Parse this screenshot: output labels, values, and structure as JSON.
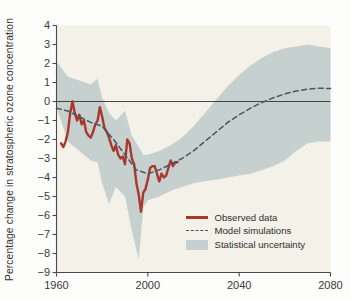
{
  "figure": {
    "background": "#fdfdfb",
    "plot_background": "#f4f1e9"
  },
  "axis": {
    "ylabel": "Percentage change in stratospheric ozone concentration",
    "xlabel": "",
    "y_ticks": [
      "4",
      "3",
      "2",
      "1",
      "0",
      "−1",
      "−2",
      "−3",
      "−4",
      "−5",
      "−6",
      "−7",
      "−8",
      "−9"
    ],
    "x_ticks": [
      "1960",
      "2000",
      "2040",
      "2080"
    ]
  },
  "legend": {
    "items": [
      {
        "label": "Observed data",
        "key": "solid-line",
        "color": "#a8372c"
      },
      {
        "label": "Model simulations",
        "key": "dashed-line",
        "color": "#4a5668"
      },
      {
        "label": "Statistical uncertainty",
        "key": "filled-band",
        "color": "#c2cdcd"
      }
    ]
  },
  "chart_data": {
    "type": "line",
    "title": "",
    "xlabel": "",
    "ylabel": "Percentage change in stratospheric ozone concentration",
    "xlim": [
      1960,
      2080
    ],
    "ylim": [
      -9,
      4
    ],
    "xticks": [
      1960,
      2000,
      2040,
      2080
    ],
    "yticks": [
      -9,
      -8,
      -7,
      -6,
      -5,
      -4,
      -3,
      -2,
      -1,
      0,
      1,
      2,
      3,
      4
    ],
    "grid": false,
    "legend_position": "lower right",
    "zero_line": 0,
    "series": [
      {
        "name": "Observed data",
        "type": "line",
        "color": "#a8372c",
        "linestyle": "solid",
        "x": [
          1962,
          1963,
          1964,
          1965,
          1966,
          1967,
          1968,
          1969,
          1970,
          1971,
          1972,
          1973,
          1974,
          1975,
          1976,
          1977,
          1978,
          1979,
          1980,
          1981,
          1982,
          1983,
          1984,
          1985,
          1986,
          1987,
          1988,
          1989,
          1990,
          1991,
          1992,
          1993,
          1994,
          1995,
          1996,
          1997,
          1998,
          1999,
          2000,
          2001,
          2002,
          2003,
          2004,
          2005,
          2006,
          2007,
          2008,
          2009,
          2010,
          2011,
          2012,
          2013
        ],
        "values": [
          -2.2,
          -2.4,
          -2.1,
          -1.6,
          -0.6,
          0.0,
          -0.6,
          -1.0,
          -0.7,
          -1.2,
          -1.0,
          -1.6,
          -1.8,
          -1.9,
          -1.6,
          -1.2,
          -1.0,
          -0.3,
          -0.8,
          -1.4,
          -1.6,
          -1.9,
          -2.3,
          -2.6,
          -2.3,
          -2.8,
          -3.0,
          -2.9,
          -3.3,
          -2.0,
          -2.2,
          -3.0,
          -3.3,
          -4.3,
          -4.9,
          -5.8,
          -4.8,
          -4.6,
          -4.1,
          -3.5,
          -3.4,
          -3.4,
          -3.8,
          -4.2,
          -3.8,
          -4.0,
          -3.9,
          -3.5,
          -3.1,
          -3.4,
          -3.2,
          -3.2
        ]
      },
      {
        "name": "Model simulations",
        "type": "line",
        "color": "#4a5668",
        "linestyle": "dashed",
        "x": [
          1960,
          1965,
          1970,
          1975,
          1980,
          1985,
          1990,
          1995,
          2000,
          2005,
          2010,
          2015,
          2020,
          2025,
          2030,
          2035,
          2040,
          2045,
          2050,
          2055,
          2060,
          2065,
          2070,
          2075,
          2080
        ],
        "values": [
          -0.35,
          -0.5,
          -0.8,
          -1.1,
          -1.3,
          -2.0,
          -2.8,
          -3.6,
          -3.8,
          -3.6,
          -3.3,
          -3.0,
          -2.6,
          -2.1,
          -1.6,
          -1.1,
          -0.7,
          -0.35,
          -0.05,
          0.2,
          0.4,
          0.55,
          0.65,
          0.7,
          0.68
        ]
      }
    ],
    "band": {
      "name": "Statistical uncertainty",
      "color": "#c2cdcd",
      "x": [
        1960,
        1965,
        1970,
        1975,
        1978,
        1980,
        1983,
        1986,
        1990,
        1993,
        1996,
        1998,
        2000,
        2005,
        2010,
        2015,
        2020,
        2025,
        2030,
        2035,
        2040,
        2045,
        2050,
        2055,
        2060,
        2065,
        2070,
        2075,
        2080
      ],
      "upper": [
        2.1,
        1.3,
        1.1,
        0.9,
        1.2,
        0.2,
        -0.6,
        -1.0,
        -0.5,
        -1.8,
        -2.4,
        -2.8,
        -2.8,
        -2.6,
        -2.3,
        -1.9,
        -1.3,
        -0.6,
        0.1,
        0.8,
        1.4,
        1.9,
        2.3,
        2.6,
        2.8,
        2.9,
        3.0,
        2.9,
        2.8
      ],
      "lower": [
        -0.3,
        -2.1,
        -2.6,
        -3.1,
        -3.2,
        -4.3,
        -5.4,
        -4.5,
        -5.0,
        -6.8,
        -8.3,
        -5.6,
        -5.2,
        -5.0,
        -4.7,
        -4.5,
        -4.3,
        -4.2,
        -4.1,
        -4.0,
        -3.9,
        -3.8,
        -3.6,
        -3.4,
        -3.1,
        -2.6,
        -2.2,
        -2.1,
        -2.1
      ]
    }
  }
}
